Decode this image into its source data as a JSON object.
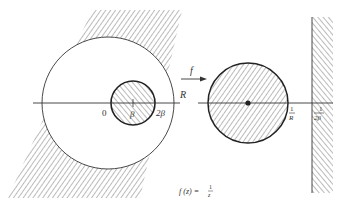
{
  "diagram": {
    "colors": {
      "ink": "#333333",
      "hatch": "#555555",
      "background": "#ffffff"
    },
    "left_plane": {
      "labels": {
        "origin": "0",
        "beta": "β",
        "two_beta": "2β",
        "radius": "R"
      },
      "regions": [
        "exterior of disk radius R (hatched, outside)",
        "disk centered at β radius β (hatched)"
      ]
    },
    "mapping": {
      "arrow_label": "f"
    },
    "right_plane": {
      "labels": {
        "one_over_R_num": "1",
        "one_over_R_den": "R",
        "one_over_2beta_num": "1",
        "one_over_2beta_den": "2β"
      },
      "regions": [
        "disk radius 1/R (hatched)",
        "half-plane Re w > 1/(2β) (hatched)"
      ]
    },
    "caption": {
      "lhs": "f (z) = ",
      "num": "1",
      "den": "z"
    }
  }
}
